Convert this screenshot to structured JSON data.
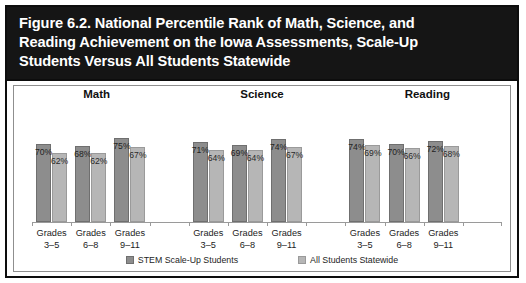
{
  "figure": {
    "title_lines": [
      "Figure 6.2. National Percentile Rank of Math, Science, and",
      "Reading Achievement on the Iowa Assessments, Scale-Up",
      "Students Versus All Students Statewide"
    ]
  },
  "colors": {
    "title_band_bg": "#151515",
    "title_text": "#ffffff",
    "series1": "#8d8d8d",
    "series2": "#b6b6b6",
    "border": "#0d0d0d",
    "axis": "#9a9a9a"
  },
  "chart_data": {
    "type": "bar",
    "title": "Figure 6.2. National Percentile Rank of Math, Science, and Reading Achievement on the Iowa Assessments, Scale-Up Students Versus All Students Statewide",
    "xlabel": "",
    "ylabel": "",
    "ylim": [
      0,
      100
    ],
    "grid": false,
    "legend_position": "bottom",
    "value_suffix": "%",
    "group_labels": [
      "Math",
      "Science",
      "Reading"
    ],
    "categories": [
      "Grades 3–5",
      "Grades 6–8",
      "Grades 9–11"
    ],
    "category_lines": [
      [
        "Grades",
        "3–5"
      ],
      [
        "Grades",
        "6–8"
      ],
      [
        "Grades",
        "9–11"
      ]
    ],
    "series": [
      {
        "name": "STEM Scale-Up Students",
        "color": "#8d8d8d",
        "values_by_group": {
          "Math": [
            70,
            68,
            75
          ],
          "Science": [
            71,
            69,
            74
          ],
          "Reading": [
            74,
            70,
            72
          ]
        }
      },
      {
        "name": "All Students Statewide",
        "color": "#b6b6b6",
        "values_by_group": {
          "Math": [
            62,
            62,
            67
          ],
          "Science": [
            64,
            64,
            67
          ],
          "Reading": [
            69,
            66,
            68
          ]
        }
      }
    ],
    "labels": {
      "Math": [
        [
          "70%",
          "62%"
        ],
        [
          "68%",
          "62%"
        ],
        [
          "75%",
          "67%"
        ]
      ],
      "Science": [
        [
          "71%",
          "64%"
        ],
        [
          "69%",
          "64%"
        ],
        [
          "74%",
          "67%"
        ]
      ],
      "Reading": [
        [
          "74%",
          "69%"
        ],
        [
          "70%",
          "66%"
        ],
        [
          "72%",
          "68%"
        ]
      ]
    }
  },
  "legend": [
    {
      "label": "STEM Scale-Up Students",
      "series": 1
    },
    {
      "label": "All Students Statewide",
      "series": 2
    }
  ]
}
